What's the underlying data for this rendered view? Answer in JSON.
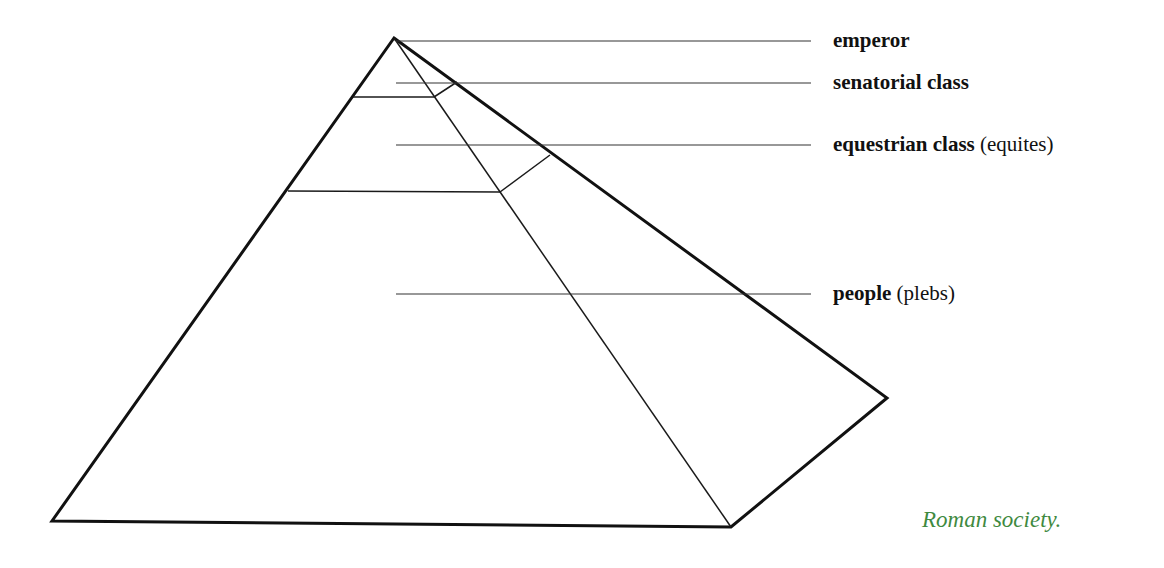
{
  "diagram": {
    "tiers": [
      {
        "id": "emperor",
        "label": "emperor",
        "note": ""
      },
      {
        "id": "senatorial",
        "label": "senatorial class",
        "note": ""
      },
      {
        "id": "equestrian",
        "label": "equestrian class",
        "note": "(equites)"
      },
      {
        "id": "people",
        "label": "people",
        "note": "(plebs)"
      }
    ]
  },
  "caption": {
    "text": "Roman society.",
    "color": "#3f8a3f"
  },
  "colors": {
    "line": "#111111",
    "text": "#111111"
  }
}
